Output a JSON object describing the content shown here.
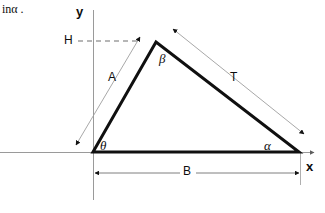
{
  "page": {
    "background_color": "#ffffff",
    "width": 325,
    "height": 213,
    "stroke_color": "#111111",
    "thin_stroke_color": "#8a8a8a",
    "axis_color": "#9a9a9a"
  },
  "fragment_text": {
    "value": "inα ."
  },
  "axes": {
    "y_label": "y",
    "x_label": "x",
    "origin": {
      "x": 93,
      "y": 152
    },
    "x_axis": {
      "x1": 0,
      "y1": 152,
      "x2": 318,
      "y2": 152
    },
    "y_axis": {
      "x1": 93,
      "y1": 12,
      "x2": 93,
      "y2": 200
    }
  },
  "triangle": {
    "vertex_origin": {
      "x": 93,
      "y": 152
    },
    "vertex_apex": {
      "x": 156,
      "y": 42
    },
    "vertex_right": {
      "x": 299,
      "y": 152
    },
    "angle_labels": [
      {
        "name": "theta",
        "glyph": "θ",
        "x": 101,
        "y": 141
      },
      {
        "name": "beta",
        "glyph": "β",
        "x": 160,
        "y": 55
      },
      {
        "name": "alpha",
        "glyph": "α",
        "x": 266,
        "y": 140
      }
    ]
  },
  "dimensions": {
    "height": {
      "label": "H",
      "label_x": 64,
      "label_y": 35,
      "dash_line": {
        "x1": 80,
        "y1": 41,
        "x2": 140,
        "y2": 41
      }
    },
    "side_a": {
      "label": "A",
      "label_x": 108,
      "label_y": 71,
      "leader": {
        "x1": 75,
        "y1": 146,
        "x2": 141,
        "y2": 36
      }
    },
    "side_t": {
      "label": "T",
      "label_x": 230,
      "label_y": 71,
      "leader": {
        "x1": 172,
        "y1": 28,
        "x2": 306,
        "y2": 136
      }
    },
    "base_b": {
      "label": "B",
      "label_x": 186,
      "label_y": 165,
      "leader": {
        "x1": 93,
        "y1": 173,
        "x2": 300,
        "y2": 173
      }
    }
  }
}
